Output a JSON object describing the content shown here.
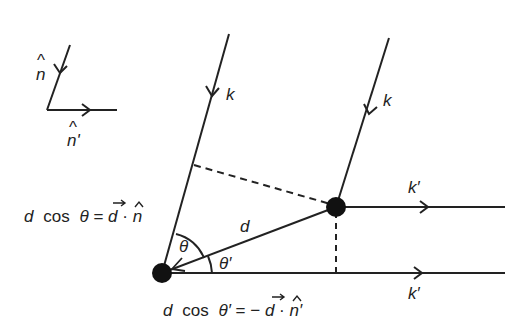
{
  "diagram": {
    "colors": {
      "stroke": "#222222",
      "background": "#ffffff"
    },
    "legend": {
      "n_hat_label": "n",
      "n_prime_hat_label": "n'",
      "hat_glyph": "^"
    },
    "labels": {
      "k_left": "k",
      "k_right": "k",
      "k_prime_top": "k′",
      "k_prime_bottom": "k′",
      "d": "d",
      "theta": "θ",
      "theta_prime": "θ′"
    },
    "equations": {
      "eq1": {
        "lhs_d": "d",
        "lhs_cos": "cos",
        "lhs_angle": "θ",
        "equals": "=",
        "rhs_vec": "d",
        "dot": "·",
        "rhs_unit": "n"
      },
      "eq2": {
        "lhs_d": "d",
        "lhs_cos": "cos",
        "lhs_angle": "θ′",
        "equals": "=",
        "minus": "−",
        "rhs_vec": "d",
        "dot": "·",
        "rhs_unit": "n′"
      }
    },
    "icons": {
      "arrow": "arrowhead",
      "scatterer": "filled-circle"
    }
  }
}
